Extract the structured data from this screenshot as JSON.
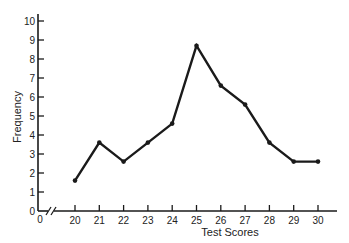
{
  "chart_data": {
    "type": "line",
    "title": "",
    "xlabel": "Test Scores",
    "ylabel": "Frequency",
    "x": [
      20,
      21,
      22,
      23,
      24,
      25,
      26,
      27,
      28,
      29,
      30
    ],
    "values": [
      1.6,
      3.6,
      2.6,
      3.6,
      4.6,
      8.7,
      6.6,
      5.6,
      3.6,
      2.6,
      2.6
    ],
    "series": [
      {
        "name": "Frequency",
        "values": [
          1.6,
          3.6,
          2.6,
          3.6,
          4.6,
          8.7,
          6.6,
          5.6,
          3.6,
          2.6,
          2.6
        ]
      }
    ],
    "x_ticks": [
      "0",
      "20",
      "21",
      "22",
      "23",
      "24",
      "25",
      "26",
      "27",
      "28",
      "29",
      "30"
    ],
    "y_ticks": [
      "0",
      "1",
      "2",
      "3",
      "4",
      "5",
      "6",
      "7",
      "8",
      "9",
      "10"
    ],
    "ylim": [
      0,
      10
    ],
    "xlim": [
      0,
      30
    ],
    "x_axis_break": true,
    "grid": false,
    "legend": false,
    "markers": true,
    "line_color": "#1a1a1a"
  }
}
